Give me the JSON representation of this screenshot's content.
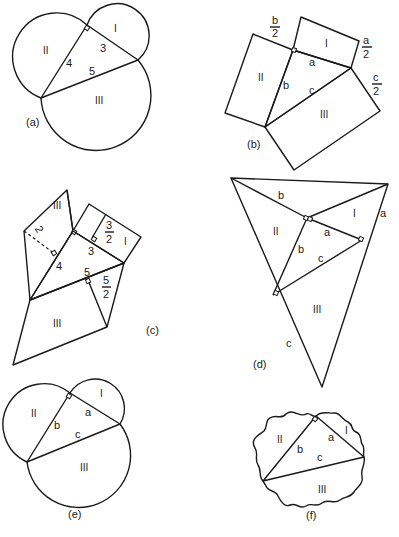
{
  "figures": {
    "a": {
      "caption": "(a)",
      "regions": [
        "I",
        "II",
        "III"
      ],
      "sides": {
        "leg_short": "3",
        "leg_long": "4",
        "hypotenuse": "5"
      }
    },
    "b": {
      "caption": "(b)",
      "regions": [
        "I",
        "II",
        "III"
      ],
      "sides": {
        "a": "a",
        "b": "b",
        "c": "c"
      },
      "half_labels": {
        "b_num": "b",
        "b_den": "2",
        "a_num": "a",
        "a_den": "2",
        "c_num": "c",
        "c_den": "2"
      }
    },
    "c": {
      "caption": "(c)",
      "regions": [
        "I",
        "II",
        "III"
      ],
      "sides": {
        "leg_short": "3",
        "leg_long": "4",
        "hypotenuse": "5"
      },
      "heights": {
        "two": "2",
        "three_num": "3",
        "three_den": "2",
        "five_num": "5",
        "five_den": "2"
      }
    },
    "d": {
      "caption": "(d)",
      "regions": [
        "I",
        "II",
        "III"
      ],
      "sides": {
        "a": "a",
        "b": "b",
        "c": "c"
      },
      "outer": {
        "a": "a",
        "b": "b",
        "c": "c"
      }
    },
    "e": {
      "caption": "(e)",
      "regions": [
        "I",
        "II",
        "III"
      ],
      "sides": {
        "a": "a",
        "b": "b",
        "c": "c"
      }
    },
    "f": {
      "caption": "(f)",
      "regions": [
        "I",
        "II",
        "III"
      ],
      "sides": {
        "a": "a",
        "b": "b",
        "c": "c"
      }
    }
  }
}
